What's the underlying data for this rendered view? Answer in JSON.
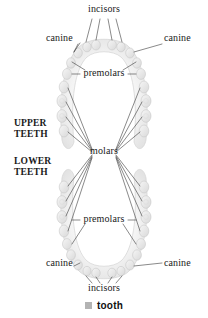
{
  "diagram": {
    "colors": {
      "tooth_fill": "#e8e8e8",
      "tooth_fill_light": "#f2f2f2",
      "tooth_outline": "#c9c9c9",
      "gum_shadow": "#dcdcdc",
      "leader_line": "#3a3a3a",
      "text": "#1a1a1a",
      "legend_swatch": "#b3b3b3",
      "background": "#ffffff"
    },
    "jaw_sections": [
      {
        "id": "upper",
        "label": "UPPER\nTEETH",
        "line1": "UPPER",
        "line2": "TEETH"
      },
      {
        "id": "lower",
        "label": "LOWER\nTEETH",
        "line1": "LOWER",
        "line2": "TEETH"
      }
    ],
    "labels": [
      {
        "id": "incisors-upper",
        "text": "incisors",
        "x": 104,
        "y": 11,
        "align": "center",
        "jaw": "upper",
        "leaders": 4
      },
      {
        "id": "canine-upper-left",
        "text": "canine",
        "x": 60,
        "y": 41,
        "align": "center",
        "jaw": "upper",
        "leaders": 1
      },
      {
        "id": "canine-upper-right",
        "text": "canine",
        "x": 180,
        "y": 41,
        "align": "center",
        "jaw": "upper",
        "leaders": 1
      },
      {
        "id": "premolars-upper",
        "text": "premolars",
        "x": 104,
        "y": 74,
        "align": "center",
        "jaw": "upper",
        "leaders": 4
      },
      {
        "id": "molars",
        "text": "molars",
        "x": 104,
        "y": 152,
        "align": "center",
        "jaw": "both",
        "leaders": 12
      },
      {
        "id": "premolars-lower",
        "text": "premolars",
        "x": 104,
        "y": 220,
        "align": "center",
        "jaw": "lower",
        "leaders": 4
      },
      {
        "id": "canine-lower-left",
        "text": "canine",
        "x": 60,
        "y": 265,
        "align": "center",
        "jaw": "lower",
        "leaders": 1
      },
      {
        "id": "canine-lower-right",
        "text": "canine",
        "x": 180,
        "y": 265,
        "align": "center",
        "jaw": "lower",
        "leaders": 1
      },
      {
        "id": "incisors-lower",
        "text": "incisors",
        "x": 104,
        "y": 290,
        "align": "center",
        "jaw": "lower",
        "leaders": 4
      }
    ],
    "jaw_label_positions": [
      {
        "id": "upper-teeth-label",
        "line1": "UPPER",
        "line2": "TEETH",
        "x": 14,
        "y": 119
      },
      {
        "id": "lower-teeth-label",
        "line1": "LOWER",
        "line2": "TEETH",
        "x": 14,
        "y": 157
      }
    ],
    "legend": {
      "swatch_color": "#b3b3b3",
      "label": "tooth"
    },
    "tooth_counts": {
      "upper_total": 16,
      "lower_total": 16,
      "incisors_per_jaw": 4,
      "canines_per_jaw": 2,
      "premolars_per_jaw": 4,
      "molars_per_jaw": 6
    }
  }
}
